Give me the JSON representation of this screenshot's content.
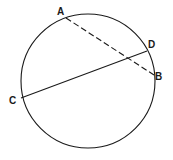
{
  "diagram": {
    "type": "circle-chords",
    "circle": {
      "cx": 88,
      "cy": 81,
      "r": 67
    },
    "points": [
      {
        "label": "A",
        "x": 66,
        "y": 18,
        "lx": 58,
        "ly": 15
      },
      {
        "label": "B",
        "x": 154,
        "y": 75,
        "lx": 155,
        "ly": 80
      },
      {
        "label": "C",
        "x": 21,
        "y": 98,
        "lx": 9,
        "ly": 105
      },
      {
        "label": "D",
        "x": 147,
        "y": 51,
        "lx": 148,
        "ly": 48
      }
    ],
    "segments": [
      {
        "from": "A",
        "to": "B",
        "style": "dashed"
      },
      {
        "from": "C",
        "to": "D",
        "style": "solid"
      }
    ],
    "stroke_color": "#1a1a1a"
  }
}
